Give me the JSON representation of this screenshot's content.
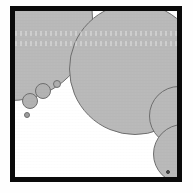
{
  "figure": {
    "background_color": "#ffffff",
    "frame": {
      "label": "black rectangular border",
      "color": "#0a0a0a",
      "thickness_px": 5,
      "x": 10,
      "y": 6,
      "width": 172,
      "height": 176
    },
    "particle_fill": "#b9b9b9",
    "particle_stroke": "#6e6e6e",
    "count_label": "9",
    "banding": [
      {
        "name": "scan-band-upper",
        "top": 20,
        "height": 5
      },
      {
        "name": "scan-band-lower",
        "top": 30,
        "height": 5
      }
    ],
    "particles": [
      {
        "name": "particle-large-topleft",
        "cx": -4,
        "cy": 8,
        "r": 82,
        "fill": "#b9b9b9",
        "stroke": "#6e6e6e"
      },
      {
        "name": "particle-large-topright",
        "cx": 120,
        "cy": 58,
        "r": 66,
        "fill": "#b9b9b9",
        "stroke": "#6e6e6e"
      },
      {
        "name": "particle-medium-rightmid",
        "cx": 164,
        "cy": 105,
        "r": 30,
        "fill": "#b9b9b9",
        "stroke": "#6e6e6e"
      },
      {
        "name": "particle-medium-rightlower",
        "cx": 168,
        "cy": 143,
        "r": 30,
        "fill": "#b9b9b9",
        "stroke": "#6e6e6e"
      },
      {
        "name": "particle-small-upper",
        "cx": 28,
        "cy": 80,
        "r": 8,
        "fill": "#b2b2b2",
        "stroke": "#6e6e6e"
      },
      {
        "name": "particle-small-lower",
        "cx": 15,
        "cy": 90,
        "r": 8,
        "fill": "#b2b2b2",
        "stroke": "#6e6e6e"
      },
      {
        "name": "particle-tiny-right",
        "cx": 42,
        "cy": 73,
        "r": 4,
        "fill": "#aeaeae",
        "stroke": "#6e6e6e"
      },
      {
        "name": "particle-tiny-bottom",
        "cx": 12,
        "cy": 104,
        "r": 3,
        "fill": "#9d9d9d",
        "stroke": "#6e6e6e"
      },
      {
        "name": "particle-dot-bottomright",
        "cx": 153,
        "cy": 161,
        "r": 2,
        "fill": "#4a4a4a",
        "stroke": "#3a3a3a"
      }
    ]
  }
}
